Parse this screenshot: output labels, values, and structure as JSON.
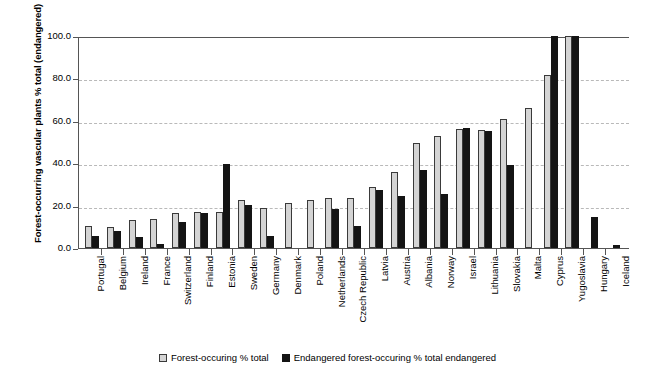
{
  "chart_data": {
    "type": "bar",
    "title": "",
    "xlabel": "",
    "ylabel": "Forest-occurring vascular plants % total (endangered)",
    "ylim": [
      0,
      100
    ],
    "ytick_labels": [
      "100.0",
      "80.0",
      "60.0",
      "40.0",
      "20.0",
      "0.0"
    ],
    "ytick_values": [
      100,
      80,
      60,
      40,
      20,
      0
    ],
    "grid": "horizontal-dashed",
    "legend_position": "bottom",
    "categories": [
      "Portugal",
      "Belgium",
      "Ireland",
      "France",
      "Switzerland",
      "Finland",
      "Estonia",
      "Sweden",
      "Germany",
      "Denmark",
      "Poland",
      "Netherlands",
      "Czech Republic",
      "Latvia",
      "Austria",
      "Albania",
      "Norway",
      "Israel",
      "Lithuania",
      "Slovakia",
      "Malta",
      "Cyprus",
      "Yugoslavia",
      "Hungary",
      "Iceland"
    ],
    "series": [
      {
        "name": "Forest-occuring % total",
        "color": "#d4d4d4",
        "values": [
          10.5,
          10.0,
          13.0,
          13.5,
          16.5,
          17.0,
          17.0,
          22.5,
          19.0,
          21.0,
          22.5,
          23.5,
          23.5,
          29.0,
          36.0,
          49.5,
          53.0,
          56.0,
          55.5,
          61.0,
          66.0,
          81.5,
          100.0,
          0,
          0
        ]
      },
      {
        "name": "Endangered forest-occuring % total endangered",
        "color": "#141414",
        "values": [
          5.5,
          8.0,
          5.0,
          2.0,
          12.5,
          16.5,
          39.5,
          20.5,
          5.5,
          0,
          0,
          18.5,
          10.5,
          27.5,
          24.5,
          37.0,
          25.5,
          56.5,
          55.0,
          39.0,
          0,
          100.0,
          100.0,
          14.5,
          1.5
        ]
      }
    ]
  },
  "legend": {
    "items": [
      {
        "label": "Forest-occuring % total",
        "swatch": "light-square-swatch"
      },
      {
        "label": "Endangered forest-occuring % total endangered",
        "swatch": "dark-square-swatch"
      }
    ]
  }
}
